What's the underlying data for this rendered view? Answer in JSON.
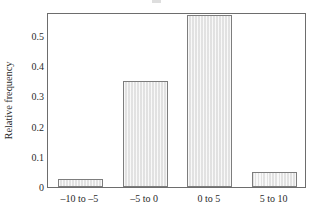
{
  "chart_data": {
    "type": "bar",
    "title": "",
    "xlabel": "",
    "ylabel": "Relative frequency",
    "categories": [
      "–10 to –5",
      "–5 to 0",
      "0 to 5",
      "5 to 10"
    ],
    "values": [
      0.028,
      0.35,
      0.57,
      0.05
    ],
    "ylim": [
      0,
      0.58
    ],
    "ytick_labels": [
      "0",
      "0.1",
      "0.2",
      "0.3",
      "0.4",
      "0.5"
    ],
    "ytick_values": [
      0,
      0.1,
      0.2,
      0.3,
      0.4,
      0.5
    ],
    "grid": false,
    "legend": false,
    "bar_fill_color": "#e6e6e6",
    "bar_border_color": "#7d7d7d",
    "axis_color": "#6d6d6d"
  },
  "axis": {
    "y_title": "Relative frequency"
  }
}
